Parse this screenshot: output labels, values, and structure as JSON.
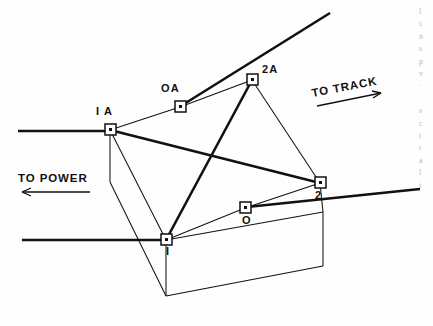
{
  "figure": {
    "type": "engineering-line-diagram",
    "background_color": "#fefefe",
    "line_color": "#111111"
  },
  "nodes": [
    {
      "id": "node-1a",
      "label": "I A",
      "x": 110,
      "y": 130,
      "label_x": 96,
      "label_y": 111
    },
    {
      "id": "node-oa",
      "label": "OA",
      "x": 180,
      "y": 107,
      "label_x": 161,
      "label_y": 87
    },
    {
      "id": "node-2a",
      "label": "2A",
      "x": 252,
      "y": 80,
      "label_x": 262,
      "label_y": 68
    },
    {
      "id": "node-2",
      "label": "2",
      "x": 320,
      "y": 183,
      "label_x": 315,
      "label_y": 190
    },
    {
      "id": "node-o",
      "label": "O",
      "x": 245,
      "y": 208,
      "label_x": 242,
      "label_y": 214
    },
    {
      "id": "node-1",
      "label": "I",
      "x": 166,
      "y": 240,
      "label_x": 167,
      "label_y": 246
    }
  ],
  "annotations": {
    "to_power": "TO POWER",
    "to_track": "TO TRACK"
  },
  "edge_text_fragment": "l\nc\nn\ns\np\nv\n·\n\ns\nc\nt\nr\na\nl\nt",
  "colors": {
    "ink": "#111111",
    "paper": "#fefefe",
    "faint_text": "#b9b9b9"
  }
}
